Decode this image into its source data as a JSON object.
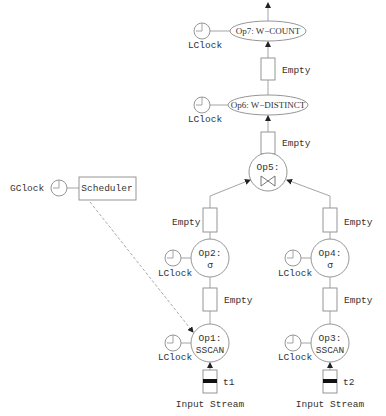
{
  "diagram": {
    "scheduler": {
      "label": "Scheduler",
      "clock_label": "GClock"
    },
    "operators": [
      {
        "id": "op7",
        "label": "Op7: W−COUNT",
        "clock_label": "LClock",
        "shape": "ellipse"
      },
      {
        "id": "op6",
        "label": "Op6: W−DISTINCT",
        "clock_label": "LClock",
        "shape": "ellipse"
      },
      {
        "id": "op5",
        "label": "Op5:",
        "symbol": "⋈",
        "shape": "circle"
      },
      {
        "id": "op2",
        "label": "Op2:",
        "symbol": "σ",
        "clock_label": "LClock",
        "shape": "circle"
      },
      {
        "id": "op4",
        "label": "Op4:",
        "symbol": "σ",
        "clock_label": "LClock",
        "shape": "circle"
      },
      {
        "id": "op1",
        "label": "Op1:",
        "symbol": "SSCAN",
        "clock_label": "LClock",
        "shape": "circle"
      },
      {
        "id": "op3",
        "label": "Op3:",
        "symbol": "SSCAN",
        "clock_label": "LClock",
        "shape": "circle"
      }
    ],
    "buffers": [
      {
        "id": "buf-op6-op7",
        "label": "Empty"
      },
      {
        "id": "buf-op5-op6",
        "label": "Empty"
      },
      {
        "id": "buf-op2-op5",
        "label": "Empty"
      },
      {
        "id": "buf-op4-op5",
        "label": "Empty"
      },
      {
        "id": "buf-op1-op2",
        "label": "Empty"
      },
      {
        "id": "buf-op3-op4",
        "label": "Empty"
      }
    ],
    "inputs": [
      {
        "id": "input-left",
        "tuple_label": "t1",
        "stream_label": "Input Stream"
      },
      {
        "id": "input-right",
        "tuple_label": "t2",
        "stream_label": "Input Stream"
      }
    ]
  }
}
